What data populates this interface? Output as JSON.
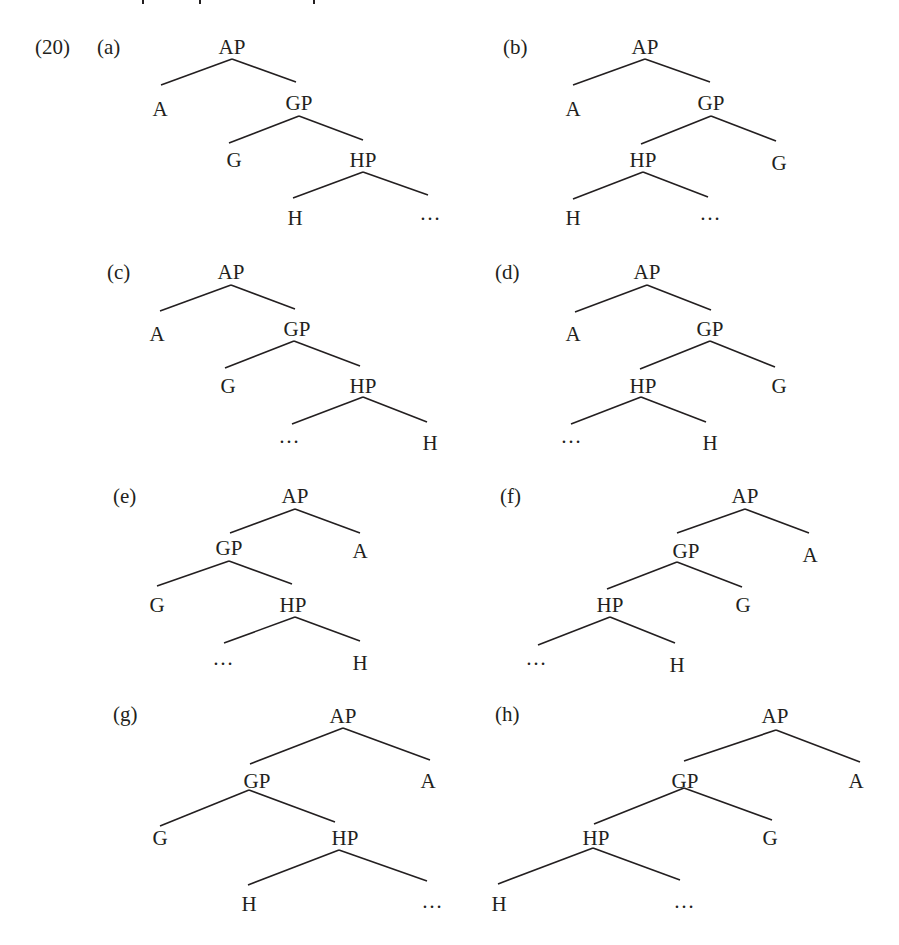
{
  "example_number": "(20)",
  "colors": {
    "ink": "#231f20",
    "background": "#ffffff"
  },
  "trees": [
    {
      "id": "a",
      "label": "(a)",
      "label_pos": [
        97,
        54
      ],
      "nodes": [
        {
          "text": "AP",
          "x": 232,
          "y": 54
        },
        {
          "text": "A",
          "x": 160,
          "y": 116
        },
        {
          "text": "GP",
          "x": 299,
          "y": 110
        },
        {
          "text": "G",
          "x": 234,
          "y": 167
        },
        {
          "text": "HP",
          "x": 363,
          "y": 167
        },
        {
          "text": "H",
          "x": 295,
          "y": 225
        },
        {
          "text": "…",
          "x": 430,
          "y": 220
        }
      ],
      "edges": [
        [
          232,
          59,
          161,
          85
        ],
        [
          232,
          59,
          296,
          82
        ],
        [
          299,
          116,
          229,
          143
        ],
        [
          299,
          116,
          363,
          140
        ],
        [
          363,
          172,
          293,
          198
        ],
        [
          363,
          172,
          428,
          195
        ]
      ]
    },
    {
      "id": "b",
      "label": "(b)",
      "label_pos": [
        503,
        54
      ],
      "nodes": [
        {
          "text": "AP",
          "x": 645,
          "y": 54
        },
        {
          "text": "A",
          "x": 573,
          "y": 116
        },
        {
          "text": "GP",
          "x": 711,
          "y": 110
        },
        {
          "text": "HP",
          "x": 643,
          "y": 167
        },
        {
          "text": "G",
          "x": 779,
          "y": 170
        },
        {
          "text": "H",
          "x": 573,
          "y": 225
        },
        {
          "text": "…",
          "x": 710,
          "y": 220
        }
      ],
      "edges": [
        [
          645,
          59,
          573,
          85
        ],
        [
          645,
          59,
          710,
          82
        ],
        [
          711,
          116,
          641,
          144
        ],
        [
          711,
          116,
          776,
          141
        ],
        [
          643,
          172,
          573,
          199
        ],
        [
          643,
          172,
          708,
          197
        ]
      ]
    },
    {
      "id": "c",
      "label": "(c)",
      "label_pos": [
        107,
        279
      ],
      "nodes": [
        {
          "text": "AP",
          "x": 231,
          "y": 279
        },
        {
          "text": "A",
          "x": 157,
          "y": 341
        },
        {
          "text": "GP",
          "x": 297,
          "y": 336
        },
        {
          "text": "G",
          "x": 228,
          "y": 393
        },
        {
          "text": "HP",
          "x": 363,
          "y": 393
        },
        {
          "text": "…",
          "x": 289,
          "y": 443
        },
        {
          "text": "H",
          "x": 430,
          "y": 450
        }
      ],
      "edges": [
        [
          231,
          285,
          160,
          311
        ],
        [
          231,
          285,
          295,
          309
        ],
        [
          294,
          341,
          225,
          368
        ],
        [
          294,
          341,
          360,
          366
        ],
        [
          363,
          397,
          292,
          424
        ],
        [
          363,
          397,
          427,
          422
        ]
      ]
    },
    {
      "id": "d",
      "label": "(d)",
      "label_pos": [
        495,
        279
      ],
      "nodes": [
        {
          "text": "AP",
          "x": 647,
          "y": 279
        },
        {
          "text": "A",
          "x": 573,
          "y": 341
        },
        {
          "text": "GP",
          "x": 710,
          "y": 336
        },
        {
          "text": "HP",
          "x": 643,
          "y": 393
        },
        {
          "text": "G",
          "x": 779,
          "y": 393
        },
        {
          "text": "…",
          "x": 571,
          "y": 443
        },
        {
          "text": "H",
          "x": 710,
          "y": 450
        }
      ],
      "edges": [
        [
          647,
          285,
          575,
          312
        ],
        [
          647,
          285,
          711,
          310
        ],
        [
          710,
          341,
          640,
          369
        ],
        [
          710,
          341,
          775,
          367
        ],
        [
          641,
          397,
          571,
          424
        ],
        [
          641,
          397,
          706,
          422
        ]
      ]
    },
    {
      "id": "e",
      "label": "(e)",
      "label_pos": [
        113,
        503
      ],
      "nodes": [
        {
          "text": "AP",
          "x": 295,
          "y": 503
        },
        {
          "text": "GP",
          "x": 229,
          "y": 555
        },
        {
          "text": "A",
          "x": 360,
          "y": 558
        },
        {
          "text": "G",
          "x": 157,
          "y": 612
        },
        {
          "text": "HP",
          "x": 293,
          "y": 612
        },
        {
          "text": "…",
          "x": 223,
          "y": 665
        },
        {
          "text": "H",
          "x": 360,
          "y": 670
        }
      ],
      "edges": [
        [
          295,
          509,
          230,
          533
        ],
        [
          295,
          509,
          360,
          533
        ],
        [
          229,
          561,
          157,
          586
        ],
        [
          229,
          561,
          292,
          584
        ],
        [
          295,
          617,
          224,
          643
        ],
        [
          295,
          617,
          360,
          641
        ]
      ]
    },
    {
      "id": "f",
      "label": "(f)",
      "label_pos": [
        500,
        503
      ],
      "nodes": [
        {
          "text": "AP",
          "x": 745,
          "y": 503
        },
        {
          "text": "GP",
          "x": 686,
          "y": 558
        },
        {
          "text": "A",
          "x": 810,
          "y": 562
        },
        {
          "text": "HP",
          "x": 610,
          "y": 612
        },
        {
          "text": "G",
          "x": 743,
          "y": 612
        },
        {
          "text": "…",
          "x": 536,
          "y": 665
        },
        {
          "text": "H",
          "x": 677,
          "y": 672
        }
      ],
      "edges": [
        [
          745,
          509,
          677,
          533
        ],
        [
          745,
          509,
          809,
          533
        ],
        [
          677,
          562,
          607,
          589
        ],
        [
          677,
          562,
          742,
          587
        ],
        [
          610,
          617,
          538,
          645
        ],
        [
          610,
          617,
          675,
          643
        ]
      ]
    },
    {
      "id": "g",
      "label": "(g)",
      "label_pos": [
        113,
        721
      ],
      "nodes": [
        {
          "text": "AP",
          "x": 343,
          "y": 723
        },
        {
          "text": "GP",
          "x": 257,
          "y": 788
        },
        {
          "text": "A",
          "x": 428,
          "y": 788
        },
        {
          "text": "G",
          "x": 160,
          "y": 845
        },
        {
          "text": "HP",
          "x": 345,
          "y": 845
        },
        {
          "text": "H",
          "x": 249,
          "y": 911
        },
        {
          "text": "…",
          "x": 432,
          "y": 908
        }
      ],
      "edges": [
        [
          343,
          728,
          250,
          764
        ],
        [
          343,
          728,
          430,
          760
        ],
        [
          249,
          790,
          160,
          826
        ],
        [
          249,
          790,
          335,
          822
        ],
        [
          339,
          850,
          248,
          885
        ],
        [
          339,
          850,
          427,
          881
        ]
      ]
    },
    {
      "id": "h",
      "label": "(h)",
      "label_pos": [
        495,
        721
      ],
      "nodes": [
        {
          "text": "AP",
          "x": 775,
          "y": 723
        },
        {
          "text": "GP",
          "x": 685,
          "y": 788
        },
        {
          "text": "A",
          "x": 856,
          "y": 788
        },
        {
          "text": "HP",
          "x": 596,
          "y": 845
        },
        {
          "text": "G",
          "x": 770,
          "y": 845
        },
        {
          "text": "H",
          "x": 499,
          "y": 911
        },
        {
          "text": "…",
          "x": 684,
          "y": 908
        }
      ],
      "edges": [
        [
          776,
          730,
          684,
          761
        ],
        [
          776,
          730,
          860,
          762
        ],
        [
          684,
          788,
          594,
          824
        ],
        [
          684,
          788,
          772,
          820
        ],
        [
          593,
          848,
          498,
          884
        ],
        [
          593,
          848,
          680,
          880
        ]
      ]
    }
  ]
}
